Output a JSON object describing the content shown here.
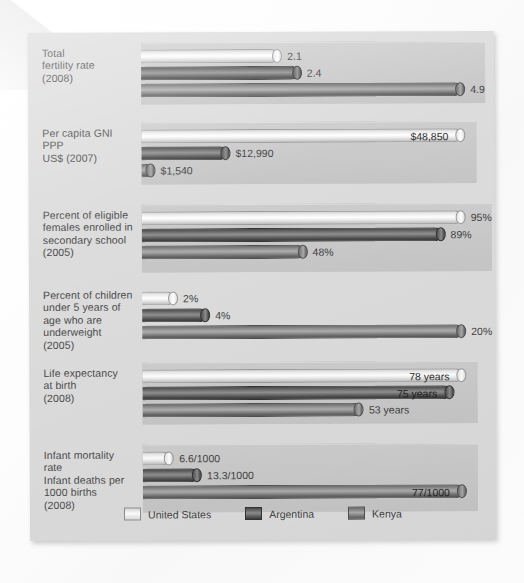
{
  "chart_data": {
    "type": "bar",
    "orientation": "horizontal-grouped",
    "title": "",
    "xlabel": "",
    "ylabel": "",
    "grid": false,
    "legend_position": "bottom",
    "series": [
      {
        "name": "United States",
        "key": "us",
        "color": "#f2f2f2"
      },
      {
        "name": "Argentina",
        "key": "ar",
        "color": "#4d4d4d"
      },
      {
        "name": "Kenya",
        "key": "ke",
        "color": "#8e8e8e"
      }
    ],
    "categories": [
      "Total fertility rate (2008)",
      "Per capita GNI PPP US$ (2007)",
      "Percent of eligible females enrolled in secondary school (2005)",
      "Percent of children under 5 years of age who are underweight (2005)",
      "Life expectancy at birth (2008)",
      "Infant mortality rate / Infant deaths per 1000 births (2008)"
    ],
    "groups": [
      {
        "label_lines": [
          "Total",
          "fertility rate",
          "(2008)"
        ],
        "max": 4.9,
        "bars": [
          {
            "series": "United States",
            "key": "us",
            "value": 2.1,
            "label": "2.1",
            "label_inside": false
          },
          {
            "series": "Argentina",
            "key": "ar",
            "value": 2.4,
            "label": "2.4",
            "label_inside": false
          },
          {
            "series": "Kenya",
            "key": "ke",
            "value": 4.9,
            "label": "4.9",
            "label_inside": false
          }
        ]
      },
      {
        "label_lines": [
          "Per capita GNI",
          "PPP",
          "US$ (2007)"
        ],
        "max": 48850,
        "bars": [
          {
            "series": "United States",
            "key": "us",
            "value": 48850,
            "label": "$48,850",
            "label_inside": true
          },
          {
            "series": "Argentina",
            "key": "ar",
            "value": 12990,
            "label": "$12,990",
            "label_inside": false
          },
          {
            "series": "Kenya",
            "key": "ke",
            "value": 1540,
            "label": "$1,540",
            "label_inside": false
          }
        ]
      },
      {
        "label_lines": [
          "Percent of eligible",
          "females enrolled in",
          "secondary school",
          "(2005)"
        ],
        "max": 95,
        "bars": [
          {
            "series": "United States",
            "key": "us",
            "value": 95,
            "label": "95%",
            "label_inside": false
          },
          {
            "series": "Argentina",
            "key": "ar",
            "value": 89,
            "label": "89%",
            "label_inside": false
          },
          {
            "series": "Kenya",
            "key": "ke",
            "value": 48,
            "label": "48%",
            "label_inside": false
          }
        ]
      },
      {
        "label_lines": [
          "Percent of children",
          "under 5 years of",
          "age who are",
          "underweight",
          "(2005)"
        ],
        "max": 20,
        "bars": [
          {
            "series": "United States",
            "key": "us",
            "value": 2,
            "label": "2%",
            "label_inside": false
          },
          {
            "series": "Argentina",
            "key": "ar",
            "value": 4,
            "label": "4%",
            "label_inside": false
          },
          {
            "series": "Kenya",
            "key": "ke",
            "value": 20,
            "label": "20%",
            "label_inside": false
          }
        ]
      },
      {
        "label_lines": [
          "Life expectancy",
          "at birth",
          "(2008)"
        ],
        "max": 78,
        "bars": [
          {
            "series": "United States",
            "key": "us",
            "value": 78,
            "label": "78 years",
            "label_inside": true
          },
          {
            "series": "Argentina",
            "key": "ar",
            "value": 75,
            "label": "75 years",
            "label_inside": true
          },
          {
            "series": "Kenya",
            "key": "ke",
            "value": 53,
            "label": "53 years",
            "label_inside": false
          }
        ]
      },
      {
        "label_lines": [
          "Infant mortality",
          "rate",
          "Infant deaths per",
          "1000 births",
          "(2008)"
        ],
        "max": 77,
        "bars": [
          {
            "series": "United States",
            "key": "us",
            "value": 6.6,
            "label": "6.6/1000",
            "label_inside": false
          },
          {
            "series": "Argentina",
            "key": "ar",
            "value": 13.3,
            "label": "13.3/1000",
            "label_inside": false
          },
          {
            "series": "Kenya",
            "key": "ke",
            "value": 77,
            "label": "77/1000",
            "label_inside": true
          }
        ]
      }
    ]
  },
  "legend": {
    "items": [
      {
        "label": "United States",
        "key": "us"
      },
      {
        "label": "Argentina",
        "key": "ar"
      },
      {
        "label": "Kenya",
        "key": "ke"
      }
    ]
  }
}
